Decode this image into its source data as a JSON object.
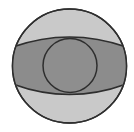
{
  "diagram": {
    "colors": {
      "background": "#ffffff",
      "outer_fill": "#c9c9c9",
      "lens_fill": "#8c8c8c",
      "inner_fill": "#8e8e8e",
      "stroke": "#2e2e2e"
    },
    "outer_circle": {
      "cx": 69.5,
      "cy": 66,
      "r": 57
    },
    "lens": {
      "left_x": 12.5,
      "right_x": 126.5,
      "tip_top_y": 48,
      "tip_bottom_y": 83,
      "top_peak_y": 37,
      "bottom_peak_y": 95
    },
    "inner_circle": {
      "cx": 70,
      "cy": 65.5,
      "r": 27
    }
  }
}
